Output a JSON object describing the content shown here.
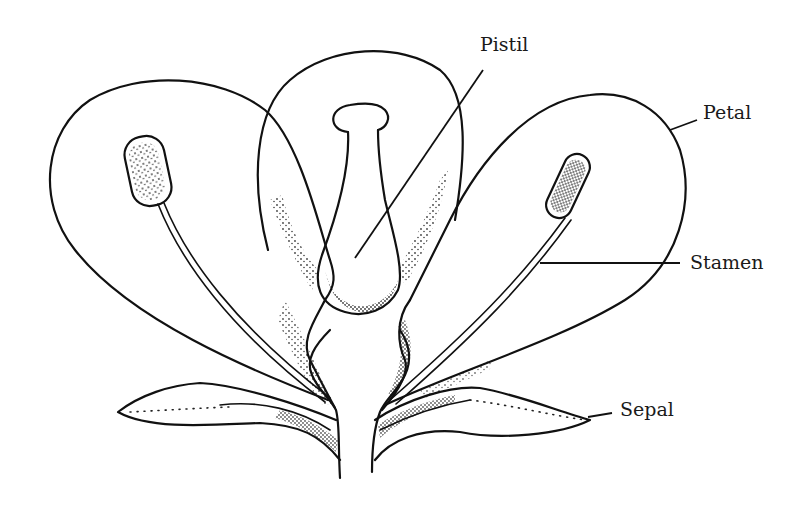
{
  "diagram": {
    "labels": {
      "pistil": "Pistil",
      "petal": "Petal",
      "stamen": "Stamen",
      "sepal": "Sepal"
    },
    "colors": {
      "ink": "#111111",
      "background": "#ffffff"
    }
  }
}
